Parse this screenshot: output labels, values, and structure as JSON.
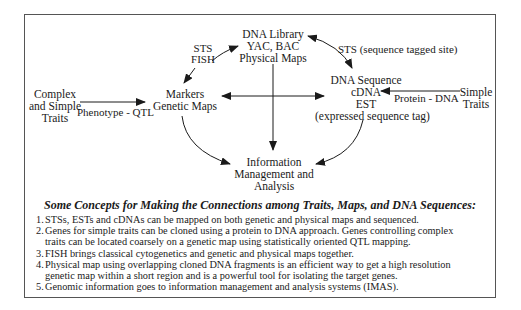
{
  "diagram": {
    "nodes": {
      "complex_traits": {
        "lines": [
          "Complex",
          "and Simple",
          "Traits"
        ]
      },
      "markers": {
        "lines": [
          "Markers",
          "Genetic Maps"
        ]
      },
      "dna_library": {
        "lines": [
          "DNA Library",
          "YAC, BAC",
          "Physical Maps"
        ]
      },
      "dna_sequence": {
        "lines": [
          "DNA Sequence",
          "cDNA",
          "EST",
          "(expressed sequence tag)"
        ]
      },
      "simple_traits": {
        "lines": [
          "Simple",
          "Traits"
        ]
      },
      "info_mgmt": {
        "lines": [
          "Information",
          "Management and",
          "Analysis"
        ]
      }
    },
    "edge_labels": {
      "sts_fish": [
        "STS",
        "FISH"
      ],
      "sts_site": "STS (sequence tagged site)",
      "phenotype_qtl": "Phenotype - QTL",
      "protein_dna": "Protein - DNA"
    },
    "colors": {
      "ink": "#1a1a1a",
      "frame": "#555555"
    }
  },
  "concepts": {
    "title": "Some Concepts for Making the Connections among Traits, Maps, and DNA Sequences:",
    "items": [
      {
        "num": "1.",
        "lines": [
          "STSs, ESTs and cDNAs can be mapped on both genetic and physical maps and sequenced."
        ]
      },
      {
        "num": "2.",
        "lines": [
          "Genes for simple traits can be cloned using a protein to DNA approach. Genes controlling complex",
          "traits can be located coarsely on a genetic map using statistically oriented QTL mapping."
        ]
      },
      {
        "num": "3.",
        "lines": [
          "FISH brings classical cytogenetics and genetic and physical maps together."
        ]
      },
      {
        "num": "4.",
        "lines": [
          "Physical map using overlapping cloned DNA fragments is an efficient way to get a high resolution",
          "genetic map within a short region and is a powerful tool for isolating the target genes."
        ]
      },
      {
        "num": "5.",
        "lines": [
          "Genomic information goes to information management and analysis systems (IMAS)."
        ]
      }
    ]
  }
}
